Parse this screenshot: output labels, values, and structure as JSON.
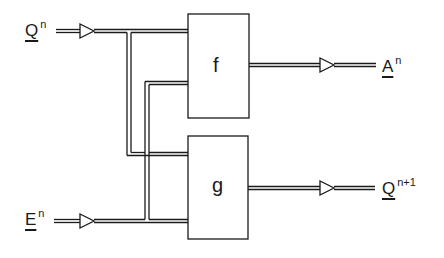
{
  "diagram": {
    "inputs": [
      {
        "base": "Q",
        "sup": "n"
      },
      {
        "base": "E",
        "sup": "n"
      }
    ],
    "outputs": [
      {
        "base": "A",
        "sup": "n"
      },
      {
        "base": "Q",
        "sup": "n+1"
      }
    ],
    "blocks": [
      {
        "label": "f"
      },
      {
        "label": "g"
      }
    ],
    "colors": {
      "line": "#1a1a1a",
      "background": "#ffffff"
    }
  }
}
